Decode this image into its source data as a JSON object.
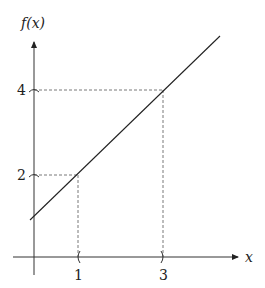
{
  "diagram": {
    "type": "function-graph",
    "y_axis_label": "f(x)",
    "x_axis_label": "x",
    "x_ticks": [
      "1",
      "3"
    ],
    "y_ticks": [
      "2",
      "4"
    ],
    "points": [
      {
        "x": 1,
        "y": 2
      },
      {
        "x": 3,
        "y": 4
      }
    ],
    "line_color": "#222222",
    "guide_color": "#555555"
  }
}
